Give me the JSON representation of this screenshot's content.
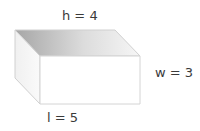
{
  "diagram": {
    "shape": "rectangular-prism",
    "labels": {
      "height": "h = 4",
      "width": "w = 3",
      "length": "l = 5"
    },
    "dimensions": {
      "h": 4,
      "w": 3,
      "l": 5
    },
    "colors": {
      "edge": "#cfcfcf",
      "top_face_dark": "#a8a8a8",
      "top_face_light": "#f4f4f4",
      "side_face": "#f7f7f7",
      "front_face": "#ffffff",
      "text": "#3a3a3a"
    }
  }
}
